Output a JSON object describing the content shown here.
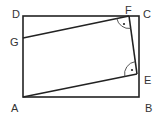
{
  "diagram": {
    "type": "geometry",
    "colors": {
      "stroke": "#222222",
      "label": "#333333",
      "background": "#ffffff"
    },
    "points": {
      "A": {
        "label": "A",
        "x": 23,
        "y": 97
      },
      "B": {
        "label": "B",
        "x": 139,
        "y": 97
      },
      "C": {
        "label": "C",
        "x": 139,
        "y": 16
      },
      "D": {
        "label": "D",
        "x": 23,
        "y": 16
      },
      "E": {
        "label": "E",
        "x": 137,
        "y": 74
      },
      "F": {
        "label": "F",
        "x": 129,
        "y": 16
      },
      "G": {
        "label": "G",
        "x": 23,
        "y": 38
      }
    },
    "rectangle": [
      "A",
      "B",
      "C",
      "D"
    ],
    "segments": [
      [
        "G",
        "F"
      ],
      [
        "F",
        "E"
      ],
      [
        "E",
        "A"
      ]
    ],
    "right_angle_marks": [
      {
        "vertex": "F",
        "between": [
          "G",
          "E"
        ]
      },
      {
        "vertex": "E",
        "between": [
          "F",
          "A"
        ]
      }
    ]
  }
}
